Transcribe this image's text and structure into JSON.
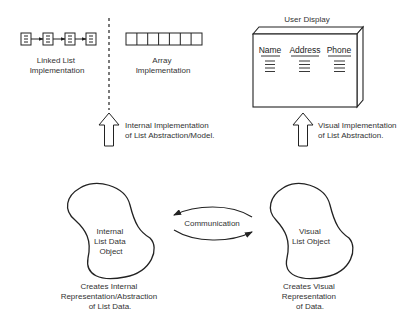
{
  "top_left": {
    "linked_list": {
      "node_count": 4,
      "caption": [
        "Linked List",
        "Implementation"
      ]
    },
    "array": {
      "cell_count": 7,
      "caption": [
        "Array",
        "Implementation"
      ]
    },
    "arrow_caption": [
      "Internal Implementation",
      "of List Abstraction/Model."
    ]
  },
  "top_right": {
    "title": "User Display",
    "columns": [
      "Name",
      "Address",
      "Phone"
    ],
    "rows_per_column": 4,
    "arrow_caption": [
      "Visual Implementation",
      "of List Abstraction."
    ]
  },
  "bottom": {
    "left_object": {
      "label": [
        "Internal",
        "List Data",
        "Object"
      ],
      "caption": [
        "Creates Internal",
        "Representation/Abstraction",
        "of List Data."
      ]
    },
    "communication": {
      "label": "Communication"
    },
    "right_object": {
      "label": [
        "Visual",
        "List Object"
      ],
      "caption": [
        "Creates Visual",
        "Representation",
        "of Data."
      ]
    }
  },
  "colors": {
    "line": "#222222",
    "text": "#333333",
    "background": "#ffffff"
  }
}
